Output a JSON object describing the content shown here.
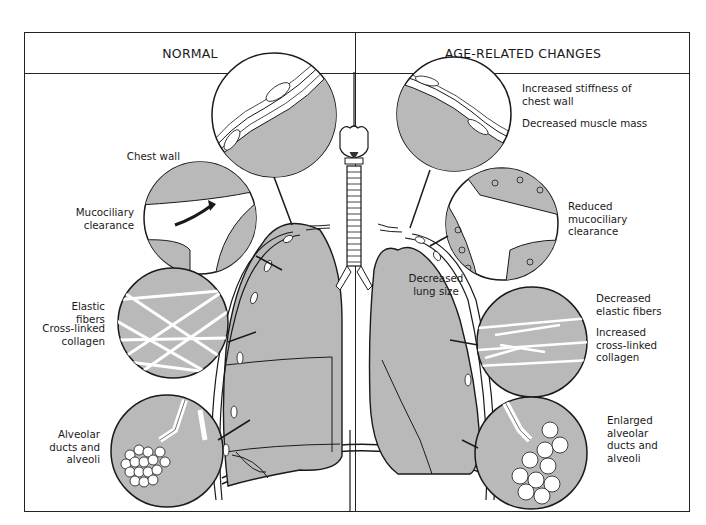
{
  "figure": {
    "headers": {
      "left": "NORMAL",
      "right": "AGE-RELATED CHANGES"
    },
    "normal_labels": {
      "chest_wall": "Chest wall",
      "mucociliary": [
        "Mucociliary",
        "clearance"
      ],
      "elastic_fibers": "Elastic fibers",
      "cross_linked": [
        "Cross-linked",
        "collagen"
      ],
      "alveolar": [
        "Alveolar",
        "ducts and",
        "alveoli"
      ]
    },
    "age_labels": {
      "stiffness": [
        "Increased stiffness of",
        "chest wall"
      ],
      "muscle_mass": "Decreased muscle mass",
      "mucociliary": [
        "Reduced",
        "mucociliary",
        "clearance"
      ],
      "lung_size": [
        "Decreased",
        "lung size"
      ],
      "elastic_fibers": [
        "Decreased",
        "elastic fibers"
      ],
      "cross_linked": [
        "Increased",
        "cross-linked",
        "collagen"
      ],
      "alveolar": [
        "Enlarged",
        "alveolar",
        "ducts and",
        "alveoli"
      ]
    },
    "colors": {
      "tissue_gray": "#b9b9b9",
      "line": "#1a1a1a",
      "background": "#ffffff"
    }
  }
}
